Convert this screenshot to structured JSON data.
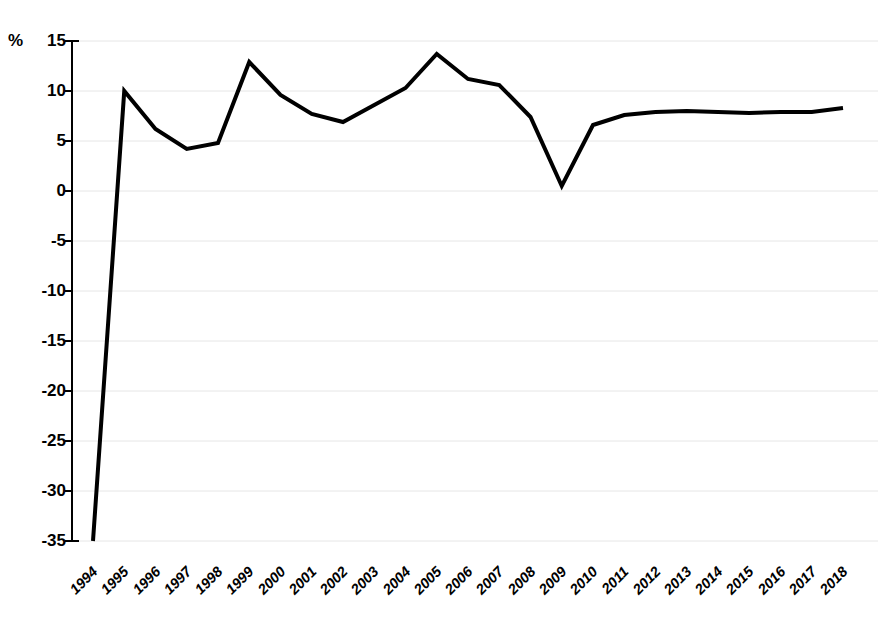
{
  "chart_data": {
    "type": "line",
    "title": "",
    "subtitle": "",
    "xlabel": "",
    "ylabel": "%",
    "unit_label": "%",
    "categories": [
      "1994",
      "1995",
      "1996",
      "1997",
      "1998",
      "1999",
      "2000",
      "2001",
      "2002",
      "2003",
      "2004",
      "2005",
      "2006",
      "2007",
      "2008",
      "2009",
      "2010",
      "2011",
      "2012",
      "2013",
      "2014",
      "2015",
      "2016",
      "2017",
      "2018"
    ],
    "values": [
      -35.0,
      10.0,
      6.2,
      4.2,
      4.8,
      12.9,
      9.6,
      7.7,
      6.9,
      8.6,
      10.3,
      13.7,
      11.2,
      10.6,
      7.4,
      0.5,
      6.6,
      7.6,
      7.9,
      8.0,
      7.9,
      7.8,
      7.9,
      7.9,
      8.3
    ],
    "series": [
      {
        "name": "series-1",
        "color": "#000000",
        "values": [
          -35.0,
          10.0,
          6.2,
          4.2,
          4.8,
          12.9,
          9.6,
          7.7,
          6.9,
          8.6,
          10.3,
          13.7,
          11.2,
          10.6,
          7.4,
          0.5,
          6.6,
          7.6,
          7.9,
          8.0,
          7.9,
          7.8,
          7.9,
          7.9,
          8.3
        ]
      }
    ],
    "ylim": [
      -35,
      15
    ],
    "ytick_values": [
      15,
      10,
      5,
      0,
      -5,
      -10,
      -15,
      -20,
      -25,
      -30,
      -35
    ],
    "ytick_labels": [
      "15",
      "10",
      "5",
      "0",
      "-5",
      "-10",
      "-15",
      "-20",
      "-25",
      "-30",
      "-35"
    ],
    "grid": true,
    "grid_color": "#e6e6e6",
    "legend": false,
    "legend_position": "none",
    "line_color": "#000000",
    "line_width": 4,
    "markers": false,
    "axis_color": "#000000",
    "background": "#ffffff"
  }
}
